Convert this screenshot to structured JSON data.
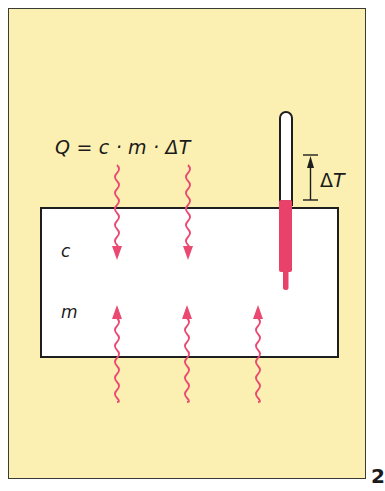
{
  "figure": {
    "formula": "Q = c · m · ΔT",
    "labels": {
      "specific_heat": "c",
      "mass": "m",
      "delta_t_symbol": "Δ",
      "delta_t_var": "T"
    },
    "page_number": "2"
  },
  "colors": {
    "background": "#fbf0b2",
    "body": "#ffffff",
    "heat_arrow": "#ea4a72",
    "thermometer_fill": "#e8426a",
    "outline": "#1e1e1e"
  },
  "arrows": {
    "incoming_top_x": [
      117,
      188
    ],
    "incoming_bottom_x": [
      117,
      187,
      258
    ]
  }
}
